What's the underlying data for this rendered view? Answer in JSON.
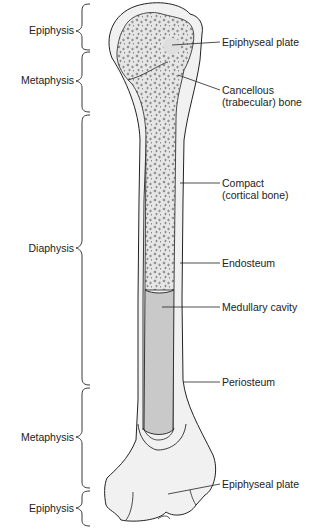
{
  "colors": {
    "background": "#ffffff",
    "bone_fill": "#f1f1f1",
    "cancellous_fill": "#e4e4e4",
    "medullary_fill": "#c9c9c9",
    "outline": "#222222"
  },
  "regions_left": [
    {
      "label": "Epiphysis",
      "y": 30
    },
    {
      "label": "Metaphysis",
      "y": 80
    },
    {
      "label": "Diaphysis",
      "y": 248
    },
    {
      "label": "Metaphysis",
      "y": 437
    },
    {
      "label": "Epiphysis",
      "y": 508
    }
  ],
  "labels_right": [
    {
      "lines": [
        "Epiphyseal plate"
      ],
      "y": 36
    },
    {
      "lines": [
        "Cancellous",
        "(trabecular) bone"
      ],
      "y": 84
    },
    {
      "lines": [
        "Compact",
        "(cortical bone)"
      ],
      "y": 177
    },
    {
      "lines": [
        "Endosteum"
      ],
      "y": 257
    },
    {
      "lines": [
        "Medullary cavity"
      ],
      "y": 301
    },
    {
      "lines": [
        "Periosteum"
      ],
      "y": 376
    },
    {
      "lines": [
        "Epiphyseal plate"
      ],
      "y": 478
    }
  ]
}
